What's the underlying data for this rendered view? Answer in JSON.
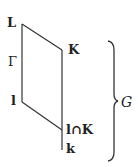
{
  "diagram": {
    "type": "field-lattice",
    "nodes": {
      "L": "L",
      "K": "K",
      "Gamma": "Γ",
      "l": "l",
      "intersection": "l∩K",
      "k": "k"
    },
    "brace_label": "G",
    "edges": [
      [
        "L",
        "K"
      ],
      [
        "L",
        "l"
      ],
      [
        "l",
        "l∩K"
      ],
      [
        "K",
        "l∩K"
      ],
      [
        "l∩K",
        "k"
      ]
    ],
    "colors": {
      "line": "#333333",
      "text": "#222222",
      "background": "#ffffff"
    }
  }
}
